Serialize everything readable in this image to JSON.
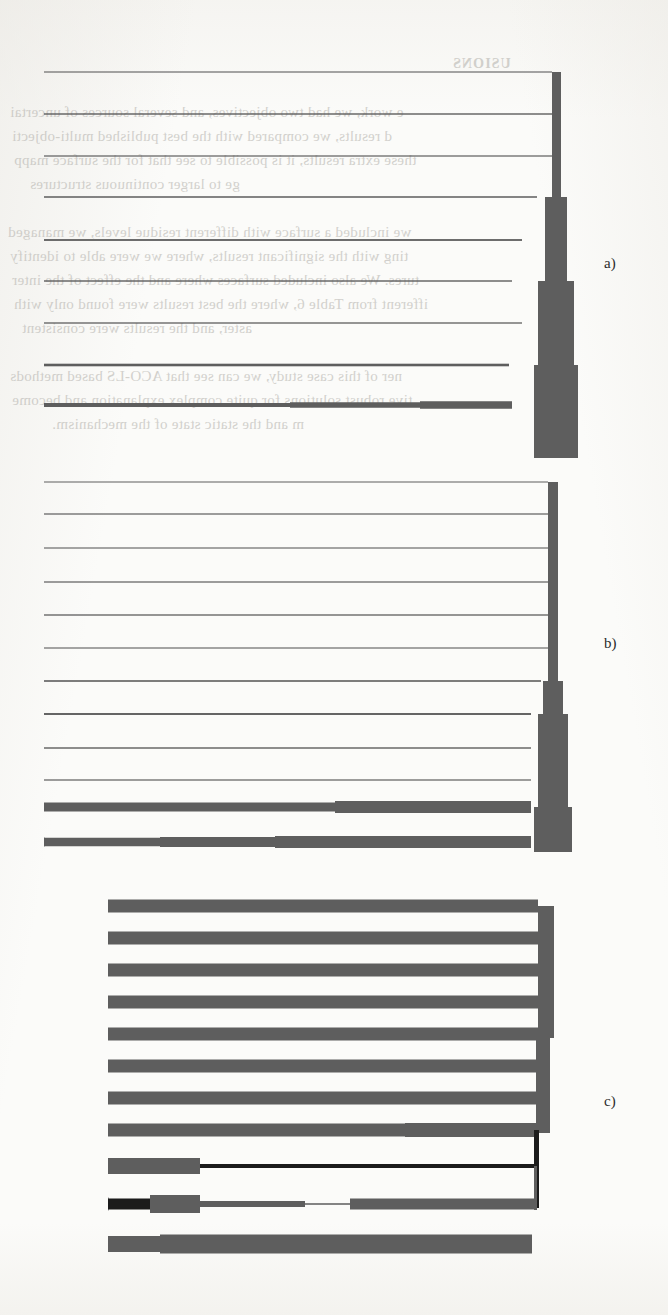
{
  "page": {
    "width": 668,
    "height": 1315,
    "background_color": "#fbfbf9",
    "ink_color": "#5e5e5e",
    "dark_ink_color": "#1b1b1b",
    "text_color": "#2b2b2b"
  },
  "ghost_text": {
    "note": "faint mirrored bleed-through text from the reverse side of the scanned page",
    "color": "#b9b7b2",
    "lines": [
      {
        "text": "USIONS",
        "x": 452,
        "y": 56,
        "size": 14,
        "head": true
      },
      {
        "text": "e work, we had two objectives, and several sources of uncertai",
        "x": 10,
        "y": 104,
        "size": 15,
        "head": false
      },
      {
        "text": "d results, we compared with the best published multi-objecti",
        "x": 12,
        "y": 128,
        "size": 15,
        "head": false
      },
      {
        "text": "these extra results, it is possible to see that for the surface mapp",
        "x": 14,
        "y": 152,
        "size": 15,
        "head": false
      },
      {
        "text": "ge to larger continuous structures",
        "x": 30,
        "y": 176,
        "size": 15,
        "head": false
      },
      {
        "text": "we included a surface with different residue levels, we managed",
        "x": 8,
        "y": 224,
        "size": 15,
        "head": false
      },
      {
        "text": "ting with the significant results, where we were able to identify",
        "x": 10,
        "y": 248,
        "size": 15,
        "head": false
      },
      {
        "text": "tures. We also included surfaces where and the effect of the inter",
        "x": 12,
        "y": 272,
        "size": 15,
        "head": false
      },
      {
        "text": "ifferent from Table 6, where the best results were found only with",
        "x": 14,
        "y": 296,
        "size": 15,
        "head": false
      },
      {
        "text": "aster, and the results were consistent",
        "x": 22,
        "y": 320,
        "size": 15,
        "head": false
      },
      {
        "text": "ner of this case study, we can see that ACO-LS based methods",
        "x": 10,
        "y": 368,
        "size": 15,
        "head": false
      },
      {
        "text": "tive robust solutions for quite complex explanation and become",
        "x": 12,
        "y": 392,
        "size": 15,
        "head": false
      },
      {
        "text": "m and the static state of the mechanism.",
        "x": 52,
        "y": 416,
        "size": 15,
        "head": false
      }
    ]
  },
  "figure": {
    "type": "dendrogram-set",
    "panels": [
      {
        "id": "a",
        "label": "a)",
        "label_x": 604,
        "label_y": 255,
        "origin_x": 0,
        "origin_y": 58,
        "width": 600,
        "height": 400,
        "leaf_count": 9,
        "root_x": 556,
        "leaf_x": 44,
        "leaves": [
          {
            "y": 14,
            "merge_x": 552,
            "thickness": 1.1
          },
          {
            "y": 56,
            "merge_x": 552,
            "thickness": 1.4
          },
          {
            "y": 98,
            "merge_x": 552,
            "thickness": 1.2
          },
          {
            "y": 139,
            "merge_x": 537,
            "thickness": 1.5
          },
          {
            "y": 182,
            "merge_x": 522,
            "thickness": 1.8
          },
          {
            "y": 223,
            "merge_x": 512,
            "thickness": 1.4
          },
          {
            "y": 265,
            "merge_x": 522,
            "thickness": 1.3
          },
          {
            "y": 307,
            "merge_x": 509,
            "thickness": 2.6
          },
          {
            "y": 347,
            "merge_x": 290,
            "thickness": 4.0
          }
        ],
        "trunk_segments": [
          {
            "x": 552,
            "y1": 14,
            "y2": 182,
            "width": 9
          },
          {
            "x": 545,
            "y1": 139,
            "y2": 268,
            "width": 22
          },
          {
            "x": 538,
            "y1": 223,
            "y2": 396,
            "width": 36
          },
          {
            "x": 534,
            "y1": 307,
            "y2": 400,
            "width": 44
          }
        ],
        "branch_bars": [
          {
            "x1": 290,
            "x2": 420,
            "y": 347,
            "thickness": 5.5
          },
          {
            "x1": 420,
            "x2": 512,
            "y": 347,
            "thickness": 7.5
          },
          {
            "x1": 100,
            "x2": 290,
            "y": 347,
            "thickness": 2.0
          }
        ]
      },
      {
        "id": "b",
        "label": "b)",
        "label_x": 604,
        "label_y": 635,
        "origin_x": 0,
        "origin_y": 462,
        "width": 600,
        "height": 390,
        "leaf_count": 12,
        "root_x": 556,
        "leaf_x": 44,
        "leaves": [
          {
            "y": 20,
            "merge_x": 548,
            "thickness": 1.0
          },
          {
            "y": 52,
            "merge_x": 548,
            "thickness": 1.2
          },
          {
            "y": 86,
            "merge_x": 548,
            "thickness": 1.1
          },
          {
            "y": 120,
            "merge_x": 548,
            "thickness": 1.2
          },
          {
            "y": 153,
            "merge_x": 548,
            "thickness": 1.3
          },
          {
            "y": 186,
            "merge_x": 548,
            "thickness": 1.1
          },
          {
            "y": 219,
            "merge_x": 541,
            "thickness": 1.6
          },
          {
            "y": 252,
            "merge_x": 531,
            "thickness": 1.9
          },
          {
            "y": 286,
            "merge_x": 531,
            "thickness": 1.4
          },
          {
            "y": 318,
            "merge_x": 531,
            "thickness": 1.2
          },
          {
            "y": 345,
            "merge_x": 100,
            "thickness": 9.0
          },
          {
            "y": 380,
            "merge_x": 44,
            "thickness": 9.0
          }
        ],
        "trunk_segments": [
          {
            "x": 548,
            "y1": 20,
            "y2": 222,
            "width": 10
          },
          {
            "x": 543,
            "y1": 219,
            "y2": 258,
            "width": 20
          },
          {
            "x": 538,
            "y1": 252,
            "y2": 400,
            "width": 30
          },
          {
            "x": 534,
            "y1": 345,
            "y2": 400,
            "width": 38
          }
        ],
        "branch_bars": [
          {
            "x1": 100,
            "x2": 335,
            "y": 345,
            "thickness": 9.0
          },
          {
            "x1": 335,
            "x2": 531,
            "y": 345,
            "thickness": 12.0
          },
          {
            "x1": 44,
            "x2": 160,
            "y": 380,
            "thickness": 8.5
          },
          {
            "x1": 160,
            "x2": 275,
            "y": 380,
            "thickness": 10.0
          },
          {
            "x1": 275,
            "x2": 531,
            "y": 380,
            "thickness": 12.0
          }
        ]
      },
      {
        "id": "c",
        "label": "c)",
        "label_x": 604,
        "label_y": 1093,
        "origin_x": 0,
        "origin_y": 898,
        "width": 600,
        "height": 400,
        "leaf_count": 11,
        "root_x": 556,
        "leaf_x": 108,
        "leaves": [
          {
            "y": 8,
            "merge_x": 538,
            "thickness": 13
          },
          {
            "y": 40,
            "merge_x": 538,
            "thickness": 13
          },
          {
            "y": 72,
            "merge_x": 538,
            "thickness": 13
          },
          {
            "y": 104,
            "merge_x": 538,
            "thickness": 13
          },
          {
            "y": 136,
            "merge_x": 538,
            "thickness": 13
          },
          {
            "y": 168,
            "merge_x": 538,
            "thickness": 13
          },
          {
            "y": 200,
            "merge_x": 538,
            "thickness": 13
          },
          {
            "y": 232,
            "merge_x": 405,
            "thickness": 13
          },
          {
            "y": 268,
            "merge_x": 200,
            "thickness": 16
          },
          {
            "y": 306,
            "merge_x": 108,
            "thickness": 13
          },
          {
            "y": 346,
            "merge_x": 108,
            "thickness": 16
          }
        ],
        "trunk_segments": [
          {
            "x": 538,
            "y1": 8,
            "y2": 140,
            "width": 16
          },
          {
            "x": 536,
            "y1": 136,
            "y2": 235,
            "width": 14
          },
          {
            "x": 534,
            "y1": 232,
            "y2": 310,
            "width": 5,
            "dark": true
          },
          {
            "x": 534,
            "y1": 268,
            "y2": 312,
            "width": 3
          }
        ],
        "branch_bars": [
          {
            "x1": 405,
            "x2": 538,
            "y": 232,
            "thickness": 14
          },
          {
            "x1": 108,
            "x2": 200,
            "y": 268,
            "thickness": 16
          },
          {
            "x1": 200,
            "x2": 534,
            "y": 268,
            "thickness": 4,
            "dark": true
          },
          {
            "x1": 108,
            "x2": 150,
            "y": 306,
            "thickness": 11,
            "dark": true
          },
          {
            "x1": 150,
            "x2": 200,
            "y": 306,
            "thickness": 18
          },
          {
            "x1": 200,
            "x2": 305,
            "y": 306,
            "thickness": 6
          },
          {
            "x1": 305,
            "x2": 350,
            "y": 306,
            "thickness": 1.5
          },
          {
            "x1": 350,
            "x2": 534,
            "y": 306,
            "thickness": 11
          },
          {
            "x1": 108,
            "x2": 160,
            "y": 346,
            "thickness": 16
          },
          {
            "x1": 160,
            "x2": 300,
            "y": 346,
            "thickness": 19
          },
          {
            "x1": 300,
            "x2": 532,
            "y": 346,
            "thickness": 19
          }
        ]
      }
    ]
  },
  "chart_data": {
    "type": "line",
    "title": "",
    "subtitle": "",
    "xlabel": "",
    "ylabel": "",
    "grid": false,
    "legend_position": "none",
    "annotations": [
      "a)",
      "b)",
      "c)"
    ],
    "series": [
      {
        "name": "a) dendrogram leaf merge distances",
        "categories": [
          "leaf 1",
          "leaf 2",
          "leaf 3",
          "leaf 4",
          "leaf 5",
          "leaf 6",
          "leaf 7",
          "leaf 8",
          "leaf 9"
        ],
        "values": [
          552,
          552,
          552,
          537,
          522,
          512,
          522,
          509,
          100
        ],
        "widths": [
          1.1,
          1.4,
          1.2,
          1.5,
          1.8,
          1.4,
          1.3,
          2.6,
          4.0
        ]
      },
      {
        "name": "b) dendrogram leaf merge distances",
        "categories": [
          "leaf 1",
          "leaf 2",
          "leaf 3",
          "leaf 4",
          "leaf 5",
          "leaf 6",
          "leaf 7",
          "leaf 8",
          "leaf 9",
          "leaf 10",
          "leaf 11",
          "leaf 12"
        ],
        "values": [
          548,
          548,
          548,
          548,
          548,
          548,
          541,
          531,
          531,
          531,
          100,
          44
        ],
        "widths": [
          1.0,
          1.2,
          1.1,
          1.2,
          1.3,
          1.1,
          1.6,
          1.9,
          1.4,
          1.2,
          9.0,
          9.0
        ]
      },
      {
        "name": "c) dendrogram leaf merge distances",
        "categories": [
          "leaf 1",
          "leaf 2",
          "leaf 3",
          "leaf 4",
          "leaf 5",
          "leaf 6",
          "leaf 7",
          "leaf 8",
          "leaf 9",
          "leaf 10",
          "leaf 11"
        ],
        "values": [
          538,
          538,
          538,
          538,
          538,
          538,
          538,
          405,
          200,
          108,
          108
        ],
        "widths": [
          13,
          13,
          13,
          13,
          13,
          13,
          13,
          13,
          16,
          13,
          16
        ]
      }
    ],
    "xlim": [
      0,
      600
    ],
    "ylim": [
      0,
      1315
    ]
  }
}
